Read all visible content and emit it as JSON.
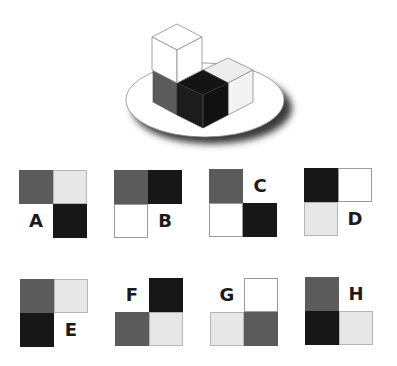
{
  "puzzle": {
    "scene": {
      "description": "Three-cube arrangement on an oval plate: white cube stacked on dark gray cube, black cube in front, light gray cube behind right",
      "colors": {
        "white": "#ffffff",
        "dark_gray": "#5b5b5b",
        "black": "#171717",
        "light_gray": "#e7e7e7",
        "plate": "#ffffff",
        "outline": "#8a8a8a"
      }
    },
    "options": [
      {
        "label": "A",
        "cells": [
          [
            "dg",
            "lg"
          ],
          [
            "label",
            "bk"
          ]
        ]
      },
      {
        "label": "B",
        "cells": [
          [
            "dg",
            "bk"
          ],
          [
            "wh",
            "label"
          ]
        ]
      },
      {
        "label": "C",
        "cells": [
          [
            "dg",
            "label"
          ],
          [
            "wh",
            "bk"
          ]
        ]
      },
      {
        "label": "D",
        "cells": [
          [
            "bk",
            "wh"
          ],
          [
            "lg",
            "label"
          ]
        ]
      },
      {
        "label": "E",
        "cells": [
          [
            "dg",
            "lg"
          ],
          [
            "bk",
            "label"
          ]
        ]
      },
      {
        "label": "F",
        "cells": [
          [
            "label",
            "bk"
          ],
          [
            "dg",
            "lg"
          ]
        ]
      },
      {
        "label": "G",
        "cells": [
          [
            "label",
            "wh"
          ],
          [
            "lg",
            "dg"
          ]
        ]
      },
      {
        "label": "H",
        "cells": [
          [
            "dg",
            "label"
          ],
          [
            "bk",
            "lg"
          ]
        ]
      }
    ]
  }
}
